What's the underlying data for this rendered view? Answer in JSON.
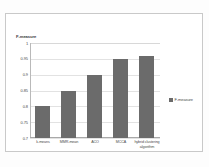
{
  "chart_data": {
    "type": "bar",
    "title": "",
    "xlabel": "",
    "ylabel": "F-measure",
    "ylim": [
      0.7,
      1.0
    ],
    "grid": true,
    "legend_position": "right",
    "categories": [
      "k-means",
      "MMR-mean",
      "ACO",
      "MCCA",
      "hybrid clustering algorithm"
    ],
    "series": [
      {
        "name": "F-measure",
        "color": "#6b6b6b",
        "values": [
          0.8,
          0.85,
          0.9,
          0.95,
          0.96
        ]
      }
    ],
    "ytick_labels": [
      "1",
      "0.95",
      "0.9",
      "0.85",
      "0.8",
      "0.75",
      "0.7"
    ],
    "ytick_values": [
      1,
      0.95,
      0.9,
      0.85,
      0.8,
      0.75,
      0.7
    ]
  },
  "legend": {
    "entries": [
      {
        "label": "F-measure",
        "color": "#6b6b6b",
        "marker": "square-swatch"
      }
    ]
  },
  "axis": {
    "y_title": "F-measure"
  }
}
